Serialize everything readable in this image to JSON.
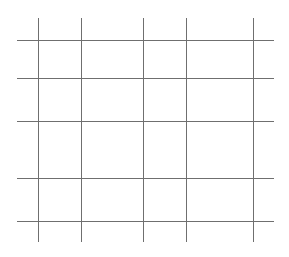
{
  "canvas": {
    "width": 289,
    "height": 257,
    "background": "#ffffff"
  },
  "grid": {
    "line_color": "#6f6f6f",
    "vertical_lines": {
      "x": [
        38,
        81,
        143,
        186,
        253
      ],
      "y_start": 18,
      "y_end": 242
    },
    "horizontal_lines": {
      "y": [
        40,
        78,
        121,
        178,
        221
      ],
      "x_start": 17,
      "x_end": 274
    }
  }
}
